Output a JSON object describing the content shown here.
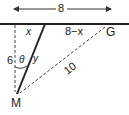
{
  "diagram": {
    "top_length_label": "8",
    "segment_x_label": "x",
    "segment_rest_label": "8−x",
    "point_G_label": "G",
    "point_M_label": "M",
    "vertical_label": "6",
    "angle_label": "θ",
    "hypotenuse_y_label": "y",
    "distance_MG_label": "10"
  }
}
